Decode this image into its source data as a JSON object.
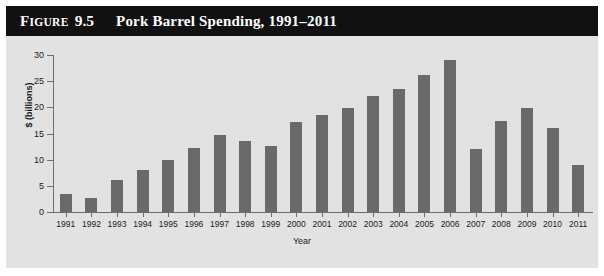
{
  "figure": {
    "label_lead": "F",
    "label_rest": "IGURE",
    "number": "9.5",
    "title": "Pork Barrel Spending, 1991–2011"
  },
  "colors": {
    "title_bar_bg": "#111111",
    "title_text": "#ffffff",
    "panel_bg": "#e2e2e2",
    "bar_fill": "#6a6a6a",
    "axis_line": "#6d6d6d",
    "tick_text": "#1b1b1b"
  },
  "chart_data": {
    "type": "bar",
    "title": "Pork Barrel Spending, 1991–2011",
    "xlabel": "Year",
    "ylabel": "$ (billions)",
    "ylim": [
      0,
      30
    ],
    "yticks": [
      0,
      5,
      10,
      15,
      20,
      25,
      30
    ],
    "ytick_labels": [
      "0",
      "5",
      "10",
      "15",
      "20",
      "25",
      "30"
    ],
    "grid": false,
    "legend": "none",
    "categories": [
      "1991",
      "1992",
      "1993",
      "1994",
      "1995",
      "1996",
      "1997",
      "1998",
      "1999",
      "2000",
      "2001",
      "2002",
      "2003",
      "2004",
      "2005",
      "2006",
      "2007",
      "2008",
      "2009",
      "2010",
      "2011"
    ],
    "values": [
      3.5,
      2.6,
      6.2,
      8.0,
      10.0,
      12.3,
      14.7,
      13.6,
      12.6,
      17.2,
      18.6,
      19.8,
      22.2,
      23.6,
      26.1,
      29.0,
      12.1,
      17.3,
      19.8,
      16.1,
      8.9
    ]
  }
}
